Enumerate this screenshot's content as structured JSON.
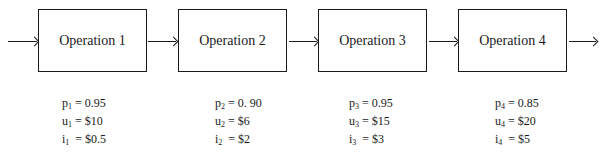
{
  "operations": [
    {
      "label": "Operation 1",
      "p_sym": "p",
      "u_sym": "u",
      "i_sym": "i",
      "idx": "1",
      "p_eq": " = 0.95",
      "u_eq": " = $10",
      "i_eq": "  = $0.5"
    },
    {
      "label": "Operation 2",
      "p_sym": "p",
      "u_sym": "u",
      "i_sym": "i",
      "idx": "2",
      "p_eq": " = 0. 90",
      "u_eq": " = $6",
      "i_eq": "  = $2"
    },
    {
      "label": "Operation 3",
      "p_sym": "p",
      "u_sym": "u",
      "i_sym": "i",
      "idx": "3",
      "p_eq": " = 0.95",
      "u_eq": " = $15",
      "i_eq": "  = $3"
    },
    {
      "label": "Operation 4",
      "p_sym": "p",
      "u_sym": "u",
      "i_sym": "i",
      "idx": "4",
      "p_eq": " = 0.85",
      "u_eq": " = $20",
      "i_eq": "  = $5"
    }
  ]
}
